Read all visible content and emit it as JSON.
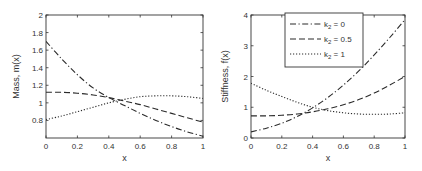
{
  "chart_data": [
    {
      "type": "line",
      "title": "",
      "xlabel": "x",
      "ylabel": "Mass, m(x)",
      "xlim": [
        0,
        1
      ],
      "ylim": [
        0.6,
        2
      ],
      "xticks": [
        0,
        0.2,
        0.4,
        0.6,
        0.8,
        1
      ],
      "xtick_labels": [
        "0",
        "0.2",
        "0.4",
        "0.6",
        "0.8",
        "1"
      ],
      "yticks": [
        0.8,
        1,
        1.2,
        1.4,
        1.6,
        1.8,
        2
      ],
      "ytick_labels": [
        "0.8",
        "1",
        "1.2",
        "1.4",
        "1.6",
        "1.8",
        "2"
      ],
      "grid": false,
      "legend": null,
      "x": [
        0,
        0.1,
        0.2,
        0.3,
        0.4,
        0.5,
        0.6,
        0.7,
        0.8,
        0.9,
        1.0
      ],
      "series": [
        {
          "name": "k2 = 0",
          "style": "dashdot",
          "values": [
            1.7,
            1.5,
            1.32,
            1.17,
            1.06,
            0.97,
            0.88,
            0.8,
            0.73,
            0.67,
            0.62
          ]
        },
        {
          "name": "k2 = 0.5",
          "style": "dashed",
          "values": [
            1.12,
            1.12,
            1.11,
            1.09,
            1.06,
            1.02,
            0.98,
            0.93,
            0.88,
            0.83,
            0.78
          ]
        },
        {
          "name": "k2 = 1",
          "style": "dotted",
          "values": [
            0.81,
            0.85,
            0.9,
            0.95,
            1.0,
            1.04,
            1.07,
            1.08,
            1.08,
            1.07,
            1.05
          ]
        }
      ]
    },
    {
      "type": "line",
      "title": "",
      "xlabel": "x",
      "ylabel": "Stiffness, f(x)",
      "xlim": [
        0,
        1
      ],
      "ylim": [
        0,
        4
      ],
      "xticks": [
        0,
        0.2,
        0.4,
        0.6,
        0.8,
        1
      ],
      "xtick_labels": [
        "0",
        "0.2",
        "0.4",
        "0.6",
        "0.8",
        "1"
      ],
      "yticks": [
        0,
        1,
        2,
        3,
        4
      ],
      "ytick_labels": [
        "0",
        "1",
        "2",
        "3",
        "4"
      ],
      "grid": false,
      "legend": {
        "position": "upper-center",
        "entries": [
          "k2 = 0",
          "k2 = 0.5",
          "k2 = 1"
        ]
      },
      "x": [
        0,
        0.1,
        0.2,
        0.3,
        0.4,
        0.5,
        0.6,
        0.7,
        0.8,
        0.9,
        1.0
      ],
      "series": [
        {
          "name": "k2 = 0",
          "style": "dashdot",
          "values": [
            0.2,
            0.32,
            0.48,
            0.7,
            0.98,
            1.32,
            1.72,
            2.18,
            2.7,
            3.26,
            3.85
          ]
        },
        {
          "name": "k2 = 0.5",
          "style": "dashed",
          "values": [
            0.72,
            0.72,
            0.74,
            0.78,
            0.85,
            0.95,
            1.08,
            1.25,
            1.46,
            1.72,
            2.0
          ]
        },
        {
          "name": "k2 = 1",
          "style": "dotted",
          "values": [
            1.78,
            1.55,
            1.35,
            1.16,
            1.0,
            0.89,
            0.82,
            0.78,
            0.77,
            0.78,
            0.82
          ]
        }
      ]
    }
  ],
  "legend": {
    "entries": [
      {
        "prefix": "k",
        "sub": "2",
        "suffix": " = 0"
      },
      {
        "prefix": "k",
        "sub": "2",
        "suffix": " = 0.5"
      },
      {
        "prefix": "k",
        "sub": "2",
        "suffix": " = 1"
      }
    ]
  },
  "colors": {
    "axis": "#333333",
    "line": "#2a2a2a",
    "text": "#333333"
  }
}
